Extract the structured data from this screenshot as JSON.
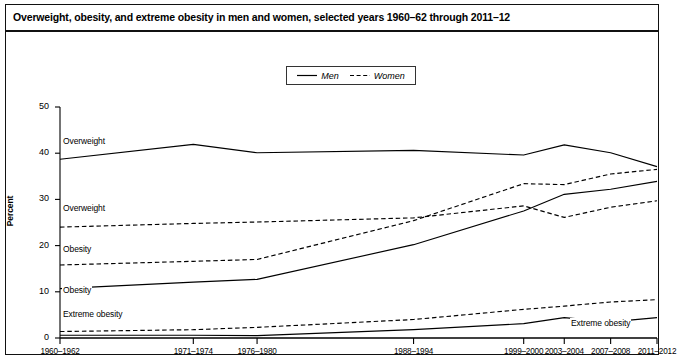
{
  "figure": {
    "title": "Overweight, obesity, and extreme obesity in men and women, selected years 1960–62 through 2011–12",
    "frame_color": "#111111"
  },
  "legend": {
    "position": "top-center",
    "entries": [
      {
        "label": "Men",
        "style": "solid",
        "icon": "solid-line-icon"
      },
      {
        "label": "Women",
        "style": "dashed",
        "icon": "dashed-line-icon"
      }
    ]
  },
  "axes": {
    "ylabel": "Percent",
    "yticks": [
      "0",
      "10",
      "20",
      "30",
      "40",
      "50"
    ],
    "ymin": 0,
    "ymax": 50,
    "xticks": [
      "1960–1962",
      "1971–1974",
      "1976–1980",
      "1988–1994",
      "1999–2000",
      "2003–2004",
      "2007–2008",
      "2011–2012"
    ]
  },
  "annotations": [
    {
      "text": "Overweight",
      "series": "men-overweight"
    },
    {
      "text": "Overweight",
      "series": "women-overweight"
    },
    {
      "text": "Obesity",
      "series": "women-obesity"
    },
    {
      "text": "Obesity",
      "series": "men-obesity"
    },
    {
      "text": "Extreme obesity",
      "series": "women-extreme-obesity"
    },
    {
      "text": "Extreme obesity",
      "series": "men-extreme-obesity"
    }
  ],
  "chart_data": {
    "type": "line",
    "title": "Overweight, obesity, and extreme obesity in men and women, selected years 1960–62 through 2011–12",
    "xlabel": "",
    "ylabel": "Percent",
    "ylim": [
      0,
      50
    ],
    "grid": false,
    "legend_position": "top-center",
    "categories": [
      "1960–1962",
      "1971–1974",
      "1976–1980",
      "1988–1994",
      "1999–2000",
      "2003–2004",
      "2007–2008",
      "2011–2012"
    ],
    "x_positions": [
      0,
      11.5,
      17,
      30.5,
      40,
      43.5,
      47.5,
      51.5
    ],
    "series": [
      {
        "name": "Men, overweight",
        "sex": "Men",
        "measure": "Overweight",
        "style": "solid",
        "values": [
          38.7,
          41.9,
          40.1,
          40.6,
          39.6,
          41.8,
          40.1,
          37.1
        ]
      },
      {
        "name": "Women, overweight",
        "sex": "Women",
        "measure": "Overweight",
        "style": "dashed",
        "values": [
          24.0,
          24.8,
          25.1,
          26.0,
          28.6,
          26.1,
          28.3,
          29.7
        ]
      },
      {
        "name": "Men, obesity",
        "sex": "Men",
        "measure": "Obesity",
        "style": "solid",
        "values": [
          10.7,
          12.1,
          12.7,
          20.2,
          27.5,
          31.1,
          32.2,
          33.9
        ]
      },
      {
        "name": "Women, obesity",
        "sex": "Women",
        "measure": "Obesity",
        "style": "dashed",
        "values": [
          15.8,
          16.6,
          17.0,
          25.4,
          33.4,
          33.2,
          35.5,
          36.5
        ]
      },
      {
        "name": "Men, extreme obesity",
        "sex": "Men",
        "measure": "Extreme obesity",
        "style": "solid",
        "values": [
          0.6,
          0.6,
          0.5,
          1.8,
          3.1,
          4.4,
          3.5,
          4.4
        ]
      },
      {
        "name": "Women, extreme obesity",
        "sex": "Women",
        "measure": "Extreme obesity",
        "style": "dashed",
        "values": [
          1.4,
          1.8,
          2.3,
          4.0,
          6.2,
          6.9,
          7.8,
          8.3
        ]
      }
    ]
  }
}
